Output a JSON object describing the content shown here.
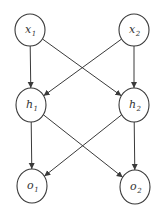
{
  "diagram": {
    "type": "neural-network",
    "nodes": [
      {
        "id": "x1",
        "base": "x",
        "sub": "1",
        "cx": 30,
        "cy": 30,
        "rx": 15,
        "ry": 16
      },
      {
        "id": "x2",
        "base": "x",
        "sub": "2",
        "cx": 134,
        "cy": 30,
        "rx": 15,
        "ry": 16
      },
      {
        "id": "h1",
        "base": "h",
        "sub": "1",
        "cx": 31,
        "cy": 105,
        "rx": 15,
        "ry": 17
      },
      {
        "id": "h2",
        "base": "h",
        "sub": "2",
        "cx": 134,
        "cy": 105,
        "rx": 15,
        "ry": 17
      },
      {
        "id": "o1",
        "base": "o",
        "sub": "1",
        "cx": 32,
        "cy": 186,
        "rx": 15,
        "ry": 17
      },
      {
        "id": "o2",
        "base": "o",
        "sub": "2",
        "cx": 135,
        "cy": 187,
        "rx": 15,
        "ry": 17
      }
    ],
    "edges": [
      {
        "from": "x1",
        "to": "h1"
      },
      {
        "from": "x1",
        "to": "h2"
      },
      {
        "from": "x2",
        "to": "h1"
      },
      {
        "from": "x2",
        "to": "h2"
      },
      {
        "from": "h1",
        "to": "o1"
      },
      {
        "from": "h1",
        "to": "o2"
      },
      {
        "from": "h2",
        "to": "o1"
      },
      {
        "from": "h2",
        "to": "o2"
      }
    ],
    "colors": {
      "stroke": "#3a3a3a",
      "background": "#ffffff"
    }
  }
}
